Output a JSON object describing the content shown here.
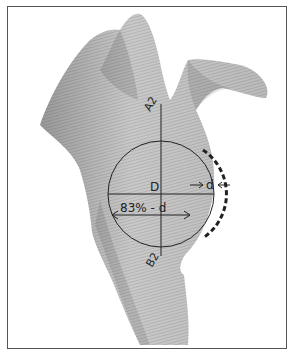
{
  "figure": {
    "type": "anatomical-diagram",
    "labels": {
      "top_axis": "A2",
      "bottom_axis": "B2",
      "diameter": "D",
      "defect": "d",
      "width_formula": "83% - d"
    },
    "colors": {
      "bone_light": "#d9d9d9",
      "bone_dark": "#9a9a9a",
      "line": "#222222",
      "frame": "#555555"
    }
  }
}
